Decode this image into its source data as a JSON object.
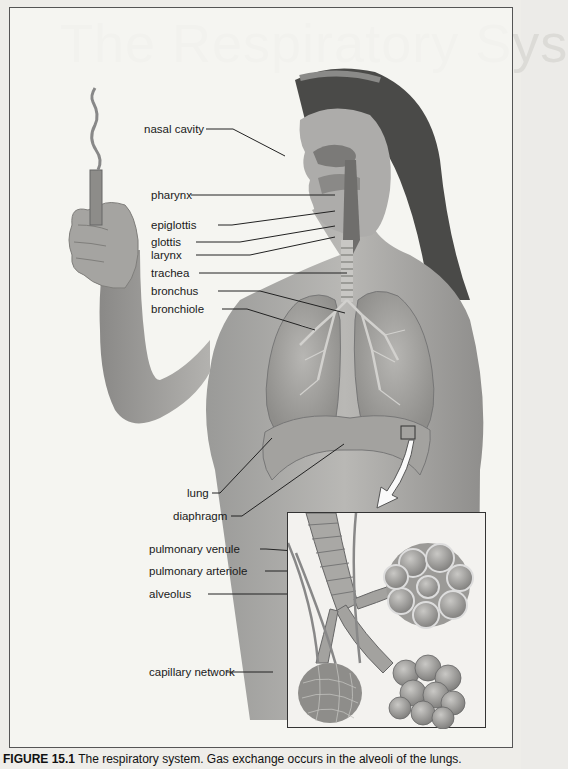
{
  "page": {
    "ghost_title": "The Respiratory Sys"
  },
  "figure": {
    "labels": [
      {
        "id": "nasal-cavity",
        "text": "nasal cavity"
      },
      {
        "id": "pharynx",
        "text": "pharynx"
      },
      {
        "id": "epiglottis",
        "text": "epiglottis"
      },
      {
        "id": "glottis",
        "text": "glottis"
      },
      {
        "id": "larynx",
        "text": "larynx"
      },
      {
        "id": "trachea",
        "text": "trachea"
      },
      {
        "id": "bronchus",
        "text": "bronchus"
      },
      {
        "id": "bronchiole",
        "text": "bronchiole"
      },
      {
        "id": "lung",
        "text": "lung"
      },
      {
        "id": "diaphragm",
        "text": "diaphragm"
      },
      {
        "id": "pulmonary-venule",
        "text": "pulmonary venule"
      },
      {
        "id": "pulmonary-arteriole",
        "text": "pulmonary arteriole"
      },
      {
        "id": "alveolus",
        "text": "alveolus"
      },
      {
        "id": "capillary-network",
        "text": "capillary network"
      }
    ],
    "caption_number": "FIGURE 15.1",
    "caption_text": " The respiratory system. Gas exchange occurs in the alveoli of the lungs."
  }
}
